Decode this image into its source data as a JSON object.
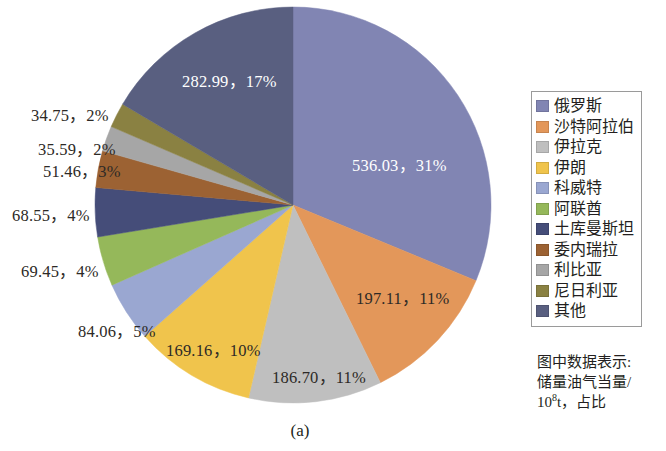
{
  "chart_data": {
    "type": "pie",
    "title": "",
    "caption": "(a)",
    "unit_note": {
      "line1": "图中数据表示:",
      "line2_prefix": "储量油气当量/",
      "line3_prefix": "10",
      "line3_sup": "8",
      "line3_suffix": "t，占比"
    },
    "start_angle_deg": 0,
    "direction": "clockwise",
    "categories": [
      "俄罗斯",
      "沙特阿拉伯",
      "伊拉克",
      "伊朗",
      "科威特",
      "阿联酋",
      "土库曼斯坦",
      "委内瑞拉",
      "利比亚",
      "尼日利亚",
      "其他"
    ],
    "values": [
      536.03,
      197.11,
      186.7,
      169.16,
      84.06,
      69.45,
      68.55,
      51.46,
      35.59,
      34.75,
      282.99
    ],
    "percents": [
      31,
      11,
      11,
      10,
      5,
      4,
      4,
      3,
      2,
      2,
      17
    ],
    "colors": [
      "#8185b3",
      "#e3975a",
      "#bfbfbf",
      "#f0c44c",
      "#9aa7d1",
      "#95b85a",
      "#454d79",
      "#9c6233",
      "#a6a6a6",
      "#8a8142",
      "#595f80"
    ],
    "data_labels": [
      {
        "text": "536.03，31%",
        "style": "light"
      },
      {
        "text": "197.11，11%",
        "style": "dark"
      },
      {
        "text": "186.70，11%",
        "style": "dark"
      },
      {
        "text": "169.16，10%",
        "style": "dark"
      },
      {
        "text": "84.06，5%",
        "style": "dark"
      },
      {
        "text": "69.45，4%",
        "style": "dark"
      },
      {
        "text": "68.55，4%",
        "style": "dark"
      },
      {
        "text": "51.46，3%",
        "style": "dark"
      },
      {
        "text": "35.59，2%",
        "style": "dark"
      },
      {
        "text": "34.75，2%",
        "style": "dark"
      },
      {
        "text": "282.99，17%",
        "style": "light"
      }
    ],
    "legend": {
      "position": "right",
      "entries": [
        {
          "label": "俄罗斯",
          "color": "#8185b3"
        },
        {
          "label": "沙特阿拉伯",
          "color": "#e3975a"
        },
        {
          "label": "伊拉克",
          "color": "#bfbfbf"
        },
        {
          "label": "伊朗",
          "color": "#f0c44c"
        },
        {
          "label": "科威特",
          "color": "#9aa7d1"
        },
        {
          "label": "阿联酋",
          "color": "#95b85a"
        },
        {
          "label": "土库曼斯坦",
          "color": "#454d79"
        },
        {
          "label": "委内瑞拉",
          "color": "#9c6233"
        },
        {
          "label": "利比亚",
          "color": "#a6a6a6"
        },
        {
          "label": "尼日利亚",
          "color": "#8a8142"
        },
        {
          "label": "其他",
          "color": "#595f80"
        }
      ]
    },
    "geometry": {
      "cx": 293,
      "cy": 205,
      "r": 198
    },
    "label_positions": [
      {
        "x": 352,
        "y": 152,
        "align": "left"
      },
      {
        "x": 356,
        "y": 285,
        "align": "left"
      },
      {
        "x": 272,
        "y": 364,
        "align": "left"
      },
      {
        "x": 166,
        "y": 337,
        "align": "left"
      },
      {
        "x": 78,
        "y": 318,
        "align": "left"
      },
      {
        "x": 21,
        "y": 258,
        "align": "left"
      },
      {
        "x": 12,
        "y": 202,
        "align": "left"
      },
      {
        "x": 43,
        "y": 158,
        "align": "left"
      },
      {
        "x": 38,
        "y": 136,
        "align": "left"
      },
      {
        "x": 31,
        "y": 102,
        "align": "left"
      },
      {
        "x": 182,
        "y": 68,
        "align": "left"
      }
    ]
  }
}
